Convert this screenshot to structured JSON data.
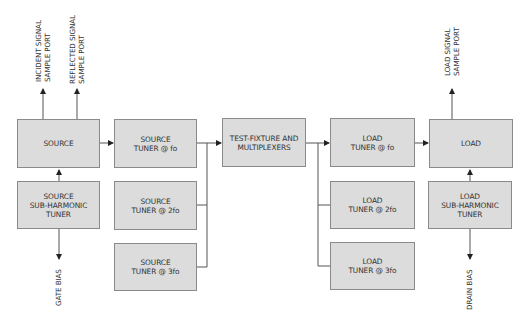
{
  "diagram": {
    "type": "block-diagram",
    "colors": {
      "box_fill": "#dcdcdc",
      "box_border": "#8a8a8a",
      "line": "#555555",
      "text": "#333333"
    },
    "blocks": {
      "source": {
        "label": "SOURCE"
      },
      "source_subharmonic": {
        "label": "SOURCE\nSUB-HARMONIC\nTUNER"
      },
      "source_tuner_fo": {
        "label": "SOURCE\nTUNER @ fo"
      },
      "source_tuner_2fo": {
        "label": "SOURCE\nTUNER @ 2fo"
      },
      "source_tuner_3fo": {
        "label": "SOURCE\nTUNER @ 3fo"
      },
      "test_fixture": {
        "label": "TEST-FIXTURE AND\nMULTIPLEXERS"
      },
      "load_tuner_fo": {
        "label": "LOAD\nTUNER @ fo"
      },
      "load_tuner_2fo": {
        "label": "LOAD\nTUNER @ 2fo"
      },
      "load_tuner_3fo": {
        "label": "LOAD\nTUNER @ 3fo"
      },
      "load": {
        "label": "LOAD"
      },
      "load_subharmonic": {
        "label": "LOAD\nSUB-HARMONIC\nTUNER"
      }
    },
    "ports": {
      "incident": "INCIDENT SIGNAL\nSAMPLE PORT",
      "reflected": "REFLECTED SIGNAL\nSAMPLE PORT",
      "load_signal": "LOAD SIGNAL\nSAMPLE PORT",
      "gate_bias": "GATE BIAS",
      "drain_bias": "DRAIN BIAS"
    },
    "connections": [
      {
        "from": "source",
        "to": "incident_signal_sample_port"
      },
      {
        "from": "source",
        "to": "reflected_signal_sample_port"
      },
      {
        "from": "source_subharmonic",
        "to": "source"
      },
      {
        "from": "source_subharmonic",
        "to": "gate_bias"
      },
      {
        "from": "source",
        "to": "source_tuner_fo"
      },
      {
        "from": "source_tuner_fo",
        "to": "test_fixture"
      },
      {
        "from": "source_tuner_2fo",
        "to": "test_fixture"
      },
      {
        "from": "source_tuner_3fo",
        "to": "test_fixture"
      },
      {
        "from": "test_fixture",
        "to": "load_tuner_fo"
      },
      {
        "from": "test_fixture",
        "to": "load_tuner_2fo"
      },
      {
        "from": "test_fixture",
        "to": "load_tuner_3fo"
      },
      {
        "from": "load_tuner_fo",
        "to": "load"
      },
      {
        "from": "load",
        "to": "load_signal_sample_port"
      },
      {
        "from": "load_subharmonic",
        "to": "load"
      },
      {
        "from": "load_subharmonic",
        "to": "drain_bias"
      }
    ]
  }
}
